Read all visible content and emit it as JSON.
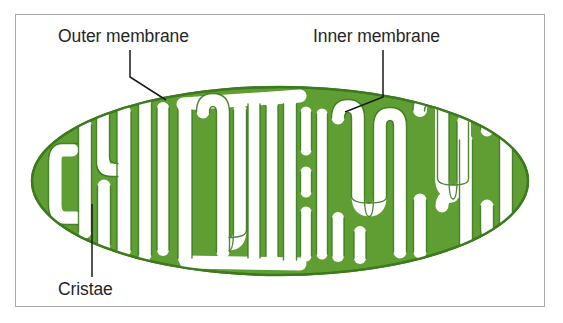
{
  "figure": {
    "background_color": "#ffffff",
    "frame_color": "#a9a9ac",
    "organelle_color": "#5f9e33",
    "organelle_outline_color": "#3c7a1e",
    "lumen_color": "#ffffff",
    "label_color": "#262626",
    "leader_color": "#1a1a1a"
  },
  "labels": {
    "outer_membrane": "Outer membrane",
    "inner_membrane": "Inner membrane",
    "cristae": "Cristae"
  },
  "annotations": [
    {
      "id": "outer-membrane",
      "text": "Outer membrane",
      "text_x": 58,
      "text_y": 42,
      "leader_points": "130,50 130,77 166,100"
    },
    {
      "id": "inner-membrane",
      "text": "Inner membrane",
      "text_x": 313,
      "text_y": 42,
      "leader_points": "383,50 383,97 345,112"
    },
    {
      "id": "cristae",
      "text": "Cristae",
      "text_x": 58,
      "text_y": 295,
      "leader_points": "92,204 92,277"
    }
  ],
  "organelle": {
    "shape": "ellipse",
    "center_x": 280,
    "center_y": 181,
    "radius_x": 248,
    "radius_y": 94
  }
}
